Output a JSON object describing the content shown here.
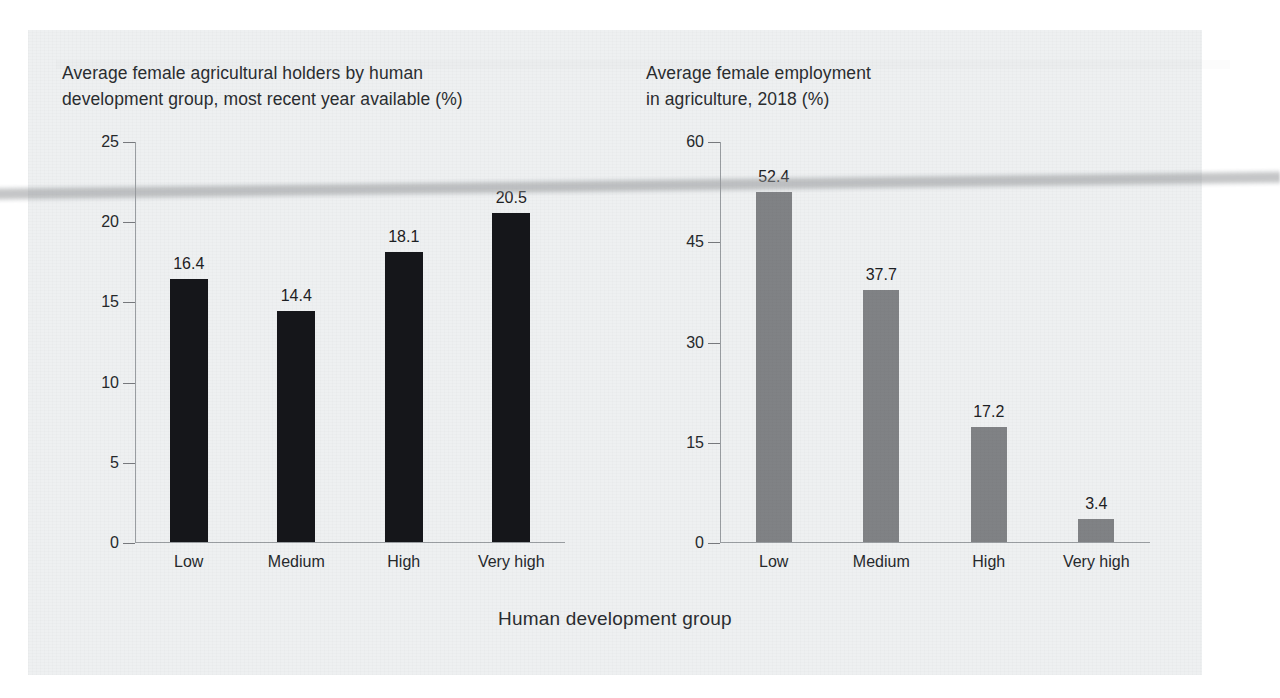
{
  "axis_caption": "Human development group",
  "left": {
    "title": "Average female agricultural holders by human\ndevelopment group, most recent year available (%)",
    "bar_color": "#15161a"
  },
  "right": {
    "title": "Average female employment\nin agriculture, 2018 (%)",
    "bar_color": "#808285"
  },
  "chart_data": [
    {
      "type": "bar",
      "title": "Average female agricultural holders by human development group, most recent year available (%)",
      "categories": [
        "Low",
        "Medium",
        "High",
        "Very high"
      ],
      "values": [
        16.4,
        14.4,
        18.1,
        20.5
      ],
      "value_labels": [
        "16.4",
        "14.4",
        "18.1",
        "20.5"
      ],
      "yticks": [
        0,
        5,
        10,
        15,
        20,
        25
      ],
      "ytick_labels": [
        "0",
        "5",
        "10",
        "15",
        "20",
        "25"
      ],
      "ylim": [
        0,
        25
      ],
      "xlabel": "Human development group",
      "ylabel": "",
      "grid": false,
      "legend": false,
      "series_color": "#15161a"
    },
    {
      "type": "bar",
      "title": "Average female employment in agriculture, 2018 (%)",
      "categories": [
        "Low",
        "Medium",
        "High",
        "Very high"
      ],
      "values": [
        52.4,
        37.7,
        17.2,
        3.4
      ],
      "value_labels": [
        "52.4",
        "37.7",
        "17.2",
        "3.4"
      ],
      "yticks": [
        0,
        15,
        30,
        45,
        60
      ],
      "ytick_labels": [
        "0",
        "15",
        "30",
        "45",
        "60"
      ],
      "ylim": [
        0,
        60
      ],
      "xlabel": "Human development group",
      "ylabel": "",
      "grid": false,
      "legend": false,
      "series_color": "#808285"
    }
  ]
}
